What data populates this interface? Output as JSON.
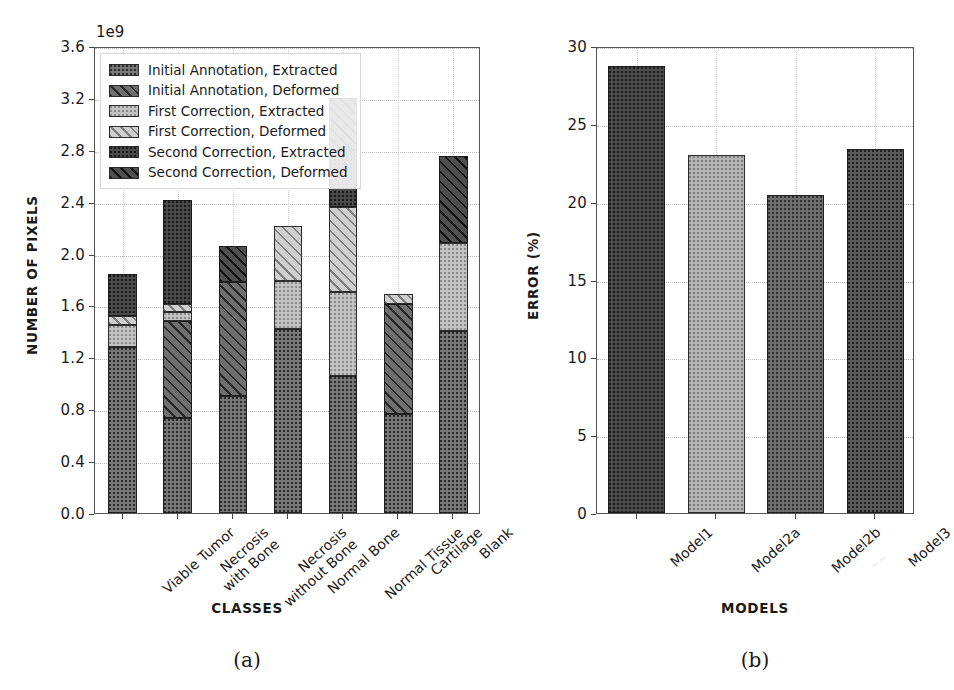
{
  "figure": {
    "subcaption_a": "(a)",
    "subcaption_b": "(b)"
  },
  "chart_data": [
    {
      "panel": "a",
      "type": "bar",
      "stacked": true,
      "title": "",
      "xlabel": "CLASSES",
      "ylabel": "NUMBER OF PIXELS",
      "y_offset_text": "1e9",
      "y_scale": 1000000000,
      "ylim": [
        0.0,
        3.6
      ],
      "yticks": [
        "0.0",
        "0.4",
        "0.8",
        "1.2",
        "1.6",
        "2.0",
        "2.4",
        "2.8",
        "3.2",
        "3.6"
      ],
      "ytick_values": [
        0.0,
        0.4,
        0.8,
        1.2,
        1.6,
        2.0,
        2.4,
        2.8,
        3.2,
        3.6
      ],
      "grid": true,
      "legend_position": "upper left",
      "categories": [
        "Viable Tumor",
        "Necrosis\nwith Bone",
        "Necrosis\nwithout Bone",
        "Normal Bone",
        "Normal Tissue",
        "Cartilage",
        "Blank"
      ],
      "series": [
        {
          "name": "Initial Annotation, Extracted",
          "fill": "f-ia-ext",
          "values": [
            1.28,
            0.73,
            0.9,
            1.42,
            1.06,
            0.76,
            1.4
          ]
        },
        {
          "name": "Initial Annotation, Deformed",
          "fill": "f-ia-def",
          "values": [
            0.0,
            0.75,
            0.88,
            0.0,
            0.0,
            0.85,
            0.0
          ]
        },
        {
          "name": "First Correction, Extracted",
          "fill": "f-fc-ext",
          "values": [
            0.17,
            0.07,
            0.0,
            0.37,
            0.64,
            0.0,
            0.68
          ]
        },
        {
          "name": "First Correction, Deformed",
          "fill": "f-fc-def",
          "values": [
            0.07,
            0.06,
            0.0,
            0.42,
            0.66,
            0.08,
            0.0
          ]
        },
        {
          "name": "Second Correction, Extracted",
          "fill": "f-sc-ext",
          "values": [
            0.32,
            0.8,
            0.0,
            0.0,
            0.44,
            0.0,
            0.0
          ]
        },
        {
          "name": "Second Correction, Deformed",
          "fill": "f-sc-def",
          "values": [
            0.0,
            0.0,
            0.28,
            0.0,
            0.4,
            0.0,
            0.67
          ]
        }
      ],
      "totals": [
        1.84,
        2.41,
        2.06,
        2.21,
        3.2,
        1.69,
        2.75
      ]
    },
    {
      "panel": "b",
      "type": "bar",
      "stacked": false,
      "title": "",
      "xlabel": "MODELS",
      "ylabel": "ERROR (%)",
      "ylim": [
        0,
        30
      ],
      "yticks": [
        "0",
        "5",
        "10",
        "15",
        "20",
        "25",
        "30"
      ],
      "ytick_values": [
        0,
        5,
        10,
        15,
        20,
        25,
        30
      ],
      "grid": true,
      "categories": [
        "Model1",
        "Model2a",
        "Model2b",
        "Model3"
      ],
      "values": [
        28.7,
        23.0,
        20.4,
        23.4
      ],
      "fills": [
        "f-m1",
        "f-m2a",
        "f-m2b",
        "f-m3"
      ]
    }
  ]
}
